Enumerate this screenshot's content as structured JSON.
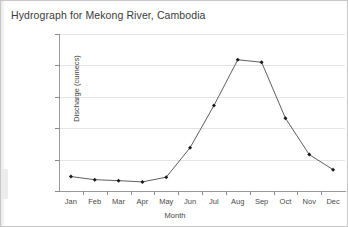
{
  "chart_data": {
    "type": "line",
    "title": "Hydrograph for Mekong River, Cambodia",
    "xlabel": "Month",
    "ylabel": "Discharge (cumecs)",
    "categories": [
      "Jan",
      "Feb",
      "Mar",
      "Apr",
      "May",
      "Jun",
      "Jul",
      "Aug",
      "Sep",
      "Oct",
      "Nov",
      "Dec"
    ],
    "values": [
      2300,
      1800,
      1650,
      1450,
      2200,
      6900,
      13600,
      20900,
      20500,
      11600,
      5800,
      3400
    ],
    "series": [
      {
        "name": "Discharge",
        "values": [
          2300,
          1800,
          1650,
          1450,
          2200,
          6900,
          13600,
          20900,
          20500,
          11600,
          5800,
          3400
        ]
      }
    ],
    "ylim": [
      0,
      25000
    ],
    "ytick_values": [
      0,
      5000,
      10000,
      15000,
      20000,
      25000
    ],
    "ytick_labels": [
      "0",
      "5,000",
      "10,000",
      "15,000",
      "20,000",
      "25,000"
    ],
    "grid": true,
    "legend": "none",
    "line_color": "#4d4d4d",
    "marker_color": "#1a1a1a",
    "marker": "diamond",
    "grid_color": "#e4e4e4",
    "axis_color": "#9a9a9a",
    "text_color": "#3a3a3a",
    "background": "#ffffff"
  }
}
